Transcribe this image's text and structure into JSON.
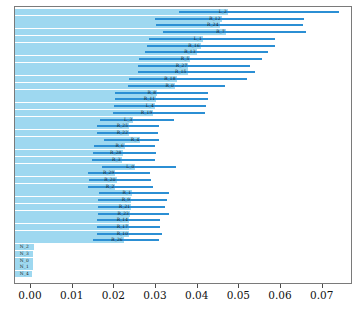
{
  "chart_data": {
    "type": "bar",
    "orientation": "horizontal",
    "title": "",
    "xlabel": "",
    "ylabel": "",
    "xlim": [
      0.0,
      0.0768
    ],
    "xticks": [
      "0.00",
      "0.01",
      "0.02",
      "0.03",
      "0.04",
      "0.05",
      "0.06",
      "0.07"
    ],
    "xtick_values": [
      0.0,
      0.01,
      0.02,
      0.03,
      0.04,
      0.05,
      0.06,
      0.07
    ],
    "grid": false,
    "legend": "none",
    "series": [
      {
        "name": "importance",
        "color": "#9ed8f0"
      },
      {
        "name": "error-interval",
        "color": "#2b8fd4"
      }
    ],
    "categories": [
      "L_2",
      "R_12",
      "R_24",
      "R_7",
      "L_1",
      "R_16",
      "R_13",
      "R_5",
      "R_27",
      "R_15",
      "R_18",
      "R_0",
      "R_8",
      "R_11",
      "L_4",
      "R_19",
      "L_3",
      "R_25",
      "R_22",
      "R_4",
      "R_6",
      "R_28",
      "R_3",
      "L_0",
      "R_29",
      "R_20",
      "R_2",
      "R_1",
      "R_9",
      "R_21",
      "R_23",
      "R_14",
      "R_17",
      "R_10",
      "R_26",
      "N_2",
      "N_3",
      "N_0",
      "N_1",
      "N_4"
    ],
    "values": [
      0.0475,
      0.046,
      0.0455,
      0.047,
      0.0415,
      0.041,
      0.04,
      0.0385,
      0.038,
      0.0378,
      0.0352,
      0.0348,
      0.0305,
      0.0303,
      0.03,
      0.0296,
      0.0248,
      0.0238,
      0.0238,
      0.0265,
      0.0228,
      0.0222,
      0.022,
      0.0253,
      0.0205,
      0.0208,
      0.0205,
      0.0245,
      0.0243,
      0.0243,
      0.024,
      0.0238,
      0.0238,
      0.0238,
      0.0225,
      0.0009,
      0.0008,
      0.0007,
      0.0006,
      0.0005
    ],
    "err_low": [
      0.0358,
      0.03,
      0.0302,
      0.0318,
      0.0285,
      0.028,
      0.0276,
      0.0262,
      0.0258,
      0.026,
      0.0238,
      0.0236,
      0.0205,
      0.0204,
      0.0202,
      0.02,
      0.0168,
      0.016,
      0.016,
      0.0178,
      0.0154,
      0.015,
      0.0149,
      0.0172,
      0.0138,
      0.0141,
      0.0138,
      0.0166,
      0.0164,
      0.0164,
      0.0162,
      0.0161,
      0.0161,
      0.0161,
      0.0152,
      0.0,
      0.0,
      0.0,
      0.0,
      0.0
    ],
    "err_high": [
      0.0742,
      0.0658,
      0.0656,
      0.0662,
      0.0588,
      0.0588,
      0.057,
      0.0556,
      0.0528,
      0.054,
      0.052,
      0.0468,
      0.0428,
      0.0428,
      0.0422,
      0.042,
      0.0346,
      0.031,
      0.0308,
      0.031,
      0.03,
      0.0302,
      0.03,
      0.035,
      0.0288,
      0.029,
      0.0294,
      0.0334,
      0.033,
      0.0324,
      0.0334,
      0.0312,
      0.0312,
      0.0316,
      0.031,
      0.0018,
      0.0016,
      0.0014,
      0.0012,
      0.001
    ],
    "colors": {
      "bar": "#9ed8f0",
      "error": "#2b8fd4",
      "frame": "#7a7a7a",
      "text": "#1a1a1a",
      "background": "#ffffff"
    }
  },
  "axis": {
    "tick_0": "0.00",
    "tick_1": "0.01",
    "tick_2": "0.02",
    "tick_3": "0.03",
    "tick_4": "0.04",
    "tick_5": "0.05",
    "tick_6": "0.06",
    "tick_7": "0.07"
  },
  "caption": {
    "text": ""
  }
}
